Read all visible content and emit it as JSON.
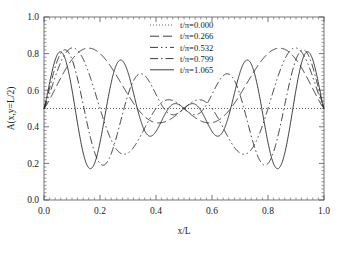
{
  "chart_data": {
    "type": "line",
    "title": "",
    "xlabel": "x/L",
    "ylabel": "A(x,y=L/2)",
    "xlim": [
      0.0,
      1.0
    ],
    "ylim": [
      0.0,
      1.0
    ],
    "xticks": [
      "0.0",
      "0.2",
      "0.4",
      "0.6",
      "0.8",
      "1.0"
    ],
    "yticks": [
      "0.0",
      "0.2",
      "0.4",
      "0.6",
      "0.8",
      "1.0"
    ],
    "xtick_values": [
      0.0,
      0.2,
      0.4,
      0.6,
      0.8,
      1.0
    ],
    "ytick_values": [
      0.0,
      0.2,
      0.4,
      0.6,
      0.8,
      1.0
    ],
    "minor_ticks": true,
    "grid": false,
    "legend_position": "top-center",
    "baseline": 0.5,
    "series": [
      {
        "name": "t/π=0.000",
        "linestyle": "dotted",
        "amplitude": 0.0,
        "wavenumber": 0,
        "values_note": "flat line at A=0.5 across full domain"
      },
      {
        "name": "t/π=0.266",
        "linestyle": "dashed",
        "amplitude": 0.43,
        "wavenumber": 3,
        "values_note": "beating envelope, node at x=0.5, 3 lobes each half"
      },
      {
        "name": "t/π=0.532",
        "linestyle": "dash-dot-dot",
        "amplitude": 0.43,
        "wavenumber": 5,
        "values_note": "beating envelope, node at x=0.5, 5 lobes each half"
      },
      {
        "name": "t/π=0.799",
        "linestyle": "dash-dot",
        "amplitude": 0.43,
        "wavenumber": 7,
        "values_note": "beating envelope, node at x=0.5, 7 lobes each half"
      },
      {
        "name": "t/π=1.065",
        "linestyle": "solid",
        "amplitude": 0.43,
        "wavenumber": 9,
        "values_note": "beating envelope, node at x=0.5, 9 lobes each half"
      }
    ],
    "envelope_note": "amplitude grows from 0 at x=0.5 toward maxima near x=0.08 and x=0.92; peaks reach ~0.93, troughs ~0.19",
    "colors": {
      "line": "#1a1a1a",
      "frame": "#555555",
      "text": "#1a1a1a"
    }
  },
  "legend": {
    "entries": [
      {
        "label": "t/π=0.000"
      },
      {
        "label": "t/π=0.266"
      },
      {
        "label": "t/π=0.532"
      },
      {
        "label": "t/π=0.799"
      },
      {
        "label": "t/π=1.065"
      }
    ]
  },
  "axes": {
    "xlabel": "x/L",
    "ylabel": "A(x,y=L/2)",
    "xticklabels": [
      "0.0",
      "0.2",
      "0.4",
      "0.6",
      "0.8",
      "1.0"
    ],
    "yticklabels": [
      "0.0",
      "0.2",
      "0.4",
      "0.6",
      "0.8",
      "1.0"
    ]
  }
}
